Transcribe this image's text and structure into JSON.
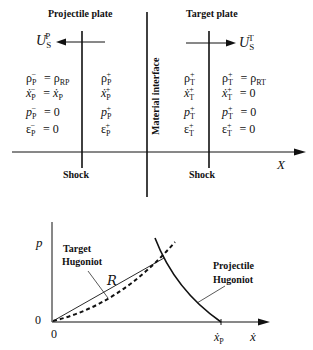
{
  "top_diagram": {
    "titles": {
      "projectile": "Projectile plate",
      "target": "Target plate"
    },
    "shock_velocity": {
      "projectile": "U_S^P",
      "target": "U_S^T"
    },
    "material_interface": "Material interface",
    "axis_label": "X",
    "shock_labels": {
      "left": "Shock",
      "right": "Shock"
    },
    "regions": {
      "projectile_unshocked": [
        "ρ_P⁻ = ρ_RP",
        "ẋ_P⁻ = ẋ_P",
        "p_P⁻ = 0",
        "ε_P⁻ = 0"
      ],
      "projectile_shocked": [
        "ρ_P⁺",
        "ẋ_P⁺",
        "p_P⁺",
        "ε_P⁺"
      ],
      "target_shocked": [
        "ρ_T⁺",
        "ẋ_T⁺",
        "p_T⁺",
        "ε_T⁺"
      ],
      "target_unshocked": [
        "ρ_T⁺ = ρ_RT",
        "ẋ_T⁺ = 0",
        "p_T⁺ = 0",
        "ε_T⁺ = 0"
      ]
    }
  },
  "bottom_plot": {
    "y_axis_label": "p",
    "x_axis_label": "ẋ",
    "origin_y": "0",
    "origin_x": "0",
    "x_marker": "ẋ_P",
    "curve_labels": {
      "target": [
        "Target",
        "Hugoniot"
      ],
      "projectile": [
        "Projectile",
        "Hugoniot"
      ],
      "rayleigh": "R"
    }
  }
}
